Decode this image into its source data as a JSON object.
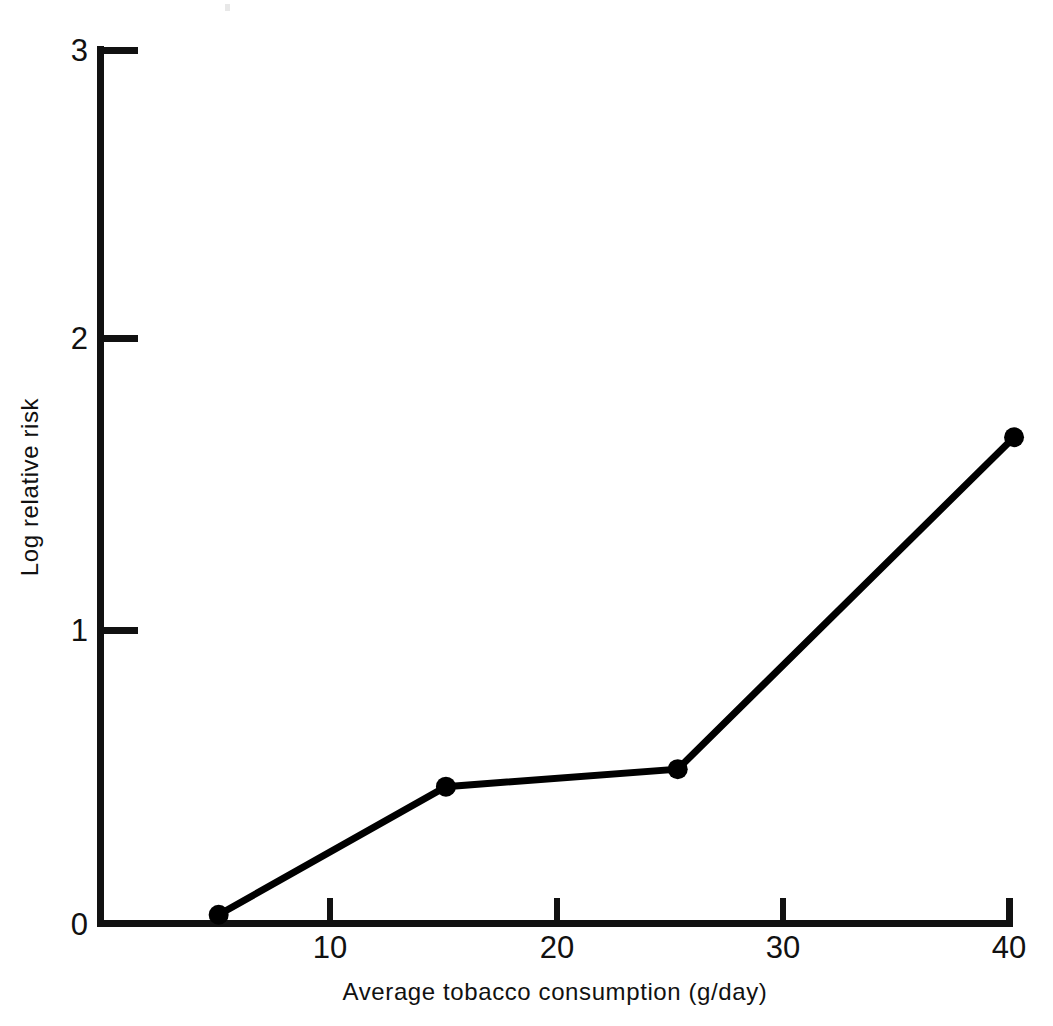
{
  "chart_data": {
    "type": "line",
    "title": "",
    "subtitle": "",
    "xlabel": "Average tobacco consumption (g/day)",
    "ylabel": "Log relative risk",
    "xlim": [
      0,
      40
    ],
    "ylim": [
      0,
      3
    ],
    "xticks": [
      0,
      10,
      20,
      30,
      40
    ],
    "xticklabels": [
      "0",
      "10",
      "20",
      "30",
      "40"
    ],
    "yticks": [
      0,
      1,
      2,
      3
    ],
    "yticklabels": [
      "0",
      "1",
      "2",
      "3"
    ],
    "grid": false,
    "legend": false,
    "legend_position": "none",
    "marker": "filled-circle",
    "line_color": "#000000",
    "marker_color": "#000000",
    "series": [
      {
        "name": "Log relative risk vs tobacco consumption",
        "x": [
          5.2,
          15.2,
          25.4,
          40.2
        ],
        "y": [
          0.03,
          0.47,
          0.53,
          1.67
        ]
      }
    ],
    "annotations": []
  },
  "axis": {
    "x_tick_0": "0",
    "x_tick_1": "10",
    "x_tick_2": "20",
    "x_tick_3": "30",
    "x_tick_4": "40",
    "y_tick_0": "0",
    "y_tick_1": "1",
    "y_tick_2": "2",
    "y_tick_3": "3",
    "x_title": "Average tobacco consumption (g/day)",
    "y_title": "Log relative risk"
  }
}
